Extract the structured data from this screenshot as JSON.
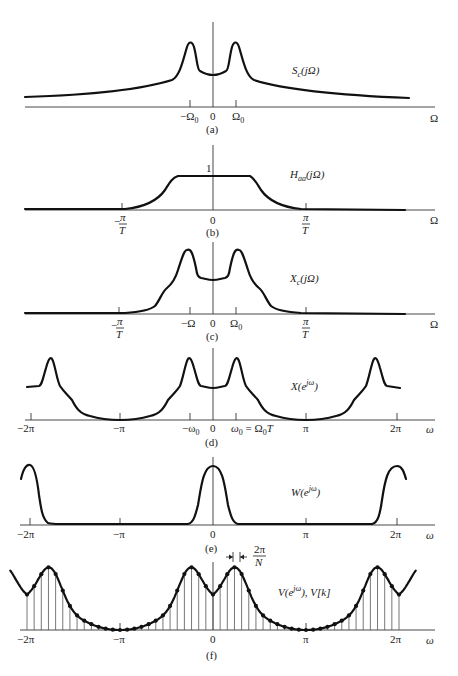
{
  "figure": {
    "panels": [
      {
        "id": "a",
        "caption": "(a)",
        "function_label": "S_c(jΩ)",
        "function_label_main": "S",
        "function_label_sub": "c",
        "function_label_arg": "(jΩ)",
        "axis_label": "Ω",
        "ticks": [
          {
            "label": "−Ω",
            "sub": "0"
          },
          {
            "label": "0",
            "sub": ""
          },
          {
            "label": "Ω",
            "sub": "0"
          }
        ]
      },
      {
        "id": "b",
        "caption": "(b)",
        "function_label_main": "H",
        "function_label_sub": "aa",
        "function_label_arg": "(jΩ)",
        "height_label": "1",
        "axis_label": "Ω",
        "ticks": [
          {
            "label": "−",
            "frac_num": "π",
            "frac_den": "T"
          },
          {
            "label": "0"
          },
          {
            "label": "",
            "frac_num": "π",
            "frac_den": "T"
          }
        ]
      },
      {
        "id": "c",
        "caption": "(c)",
        "function_label_main": "X",
        "function_label_sub": "c",
        "function_label_arg": "(jΩ)",
        "axis_label": "Ω",
        "ticks": [
          {
            "label": "−",
            "frac_num": "π",
            "frac_den": "T"
          },
          {
            "label": "−Ω"
          },
          {
            "label": "0"
          },
          {
            "label": "Ω",
            "sub": "0"
          },
          {
            "label": "",
            "frac_num": "π",
            "frac_den": "T"
          }
        ]
      },
      {
        "id": "d",
        "caption": "(d)",
        "function_label_main": "X(e",
        "function_label_sup": "jω",
        "function_label_end": ")",
        "axis_label": "ω",
        "ticks": [
          {
            "label": "−2π"
          },
          {
            "label": "−π"
          },
          {
            "label": "−ω",
            "sub": "0"
          },
          {
            "label": "0"
          },
          {
            "label": "ω",
            "sub": "0",
            "suffix": " = Ω",
            "suffix_sub": "0",
            "suffix_end": "T"
          },
          {
            "label": "π"
          },
          {
            "label": "2π"
          }
        ]
      },
      {
        "id": "e",
        "caption": "(e)",
        "function_label_main": "W(e",
        "function_label_sup": "jω",
        "function_label_end": ")",
        "axis_label": "ω",
        "ticks": [
          {
            "label": "−2π"
          },
          {
            "label": "−π"
          },
          {
            "label": "0"
          },
          {
            "label": "π"
          },
          {
            "label": "2π"
          }
        ]
      },
      {
        "id": "f",
        "caption": "(f)",
        "function_label_main": "V(e",
        "function_label_sup": "jω",
        "function_label_end": "), V[k]",
        "spacing_annotation_num": "2π",
        "spacing_annotation_den": "N",
        "axis_label": "ω",
        "ticks": [
          {
            "label": "−2π"
          },
          {
            "label": "−π"
          },
          {
            "label": "0"
          },
          {
            "label": "π"
          },
          {
            "label": "2π"
          }
        ],
        "samples_per_period": 26
      }
    ]
  }
}
